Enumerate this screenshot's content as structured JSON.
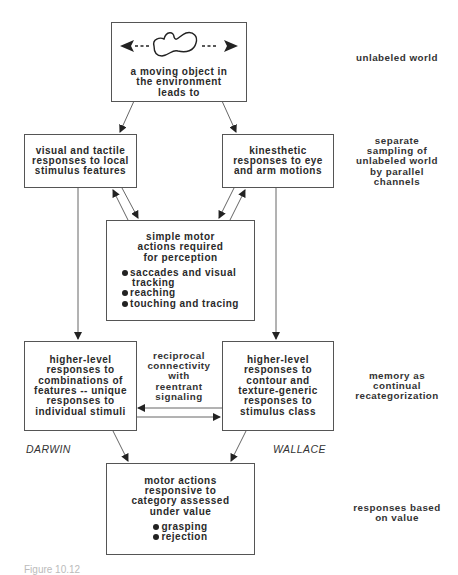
{
  "boxes": {
    "world": {
      "lines": [
        "a moving object in",
        "the environment",
        "leads to"
      ],
      "icon": "moving-blob-icon"
    },
    "visual": {
      "lines": [
        "visual and tactile",
        "responses to local",
        "stimulus features"
      ]
    },
    "kinesthetic": {
      "lines": [
        "kinesthetic",
        "responses to eye",
        "and arm motions"
      ]
    },
    "motor_simple": {
      "lines": [
        "simple motor",
        "actions required",
        "for perception"
      ],
      "bullets": [
        {
          "text": "saccades and visual",
          "cont": "tracking"
        },
        {
          "text": "reaching"
        },
        {
          "text": "touching and tracing"
        }
      ]
    },
    "higher_left": {
      "lines": [
        "higher-level",
        "responses to",
        "combinations of",
        "features -- unique",
        "responses to",
        "individual stimuli"
      ]
    },
    "higher_right": {
      "lines": [
        "higher-level",
        "responses to",
        "contour and",
        "texture-generic",
        "responses to",
        "stimulus class"
      ]
    },
    "motor_value": {
      "lines": [
        "motor actions",
        "responsive to",
        "category assessed",
        "under value"
      ],
      "bullets": [
        {
          "text": "grasping"
        },
        {
          "text": "rejection"
        }
      ]
    }
  },
  "center_label": {
    "lines": [
      "reciprocal",
      "connectivity",
      "with",
      "reentrant",
      "signaling"
    ]
  },
  "side_labels": {
    "unlabeled_world": {
      "lines": [
        "unlabeled world"
      ]
    },
    "sampling": {
      "lines": [
        "separate",
        "sampling of",
        "unlabeled world",
        "by parallel",
        "channels"
      ]
    },
    "memory": {
      "lines": [
        "memory as",
        "continual",
        "recategorization"
      ]
    },
    "value": {
      "lines": [
        "responses based",
        "on value"
      ]
    }
  },
  "names": {
    "left": "DARWIN",
    "right": "WALLACE"
  },
  "caption": "Figure 10.12",
  "colors": {
    "stroke": "#555555",
    "text": "#2a2a2a"
  }
}
